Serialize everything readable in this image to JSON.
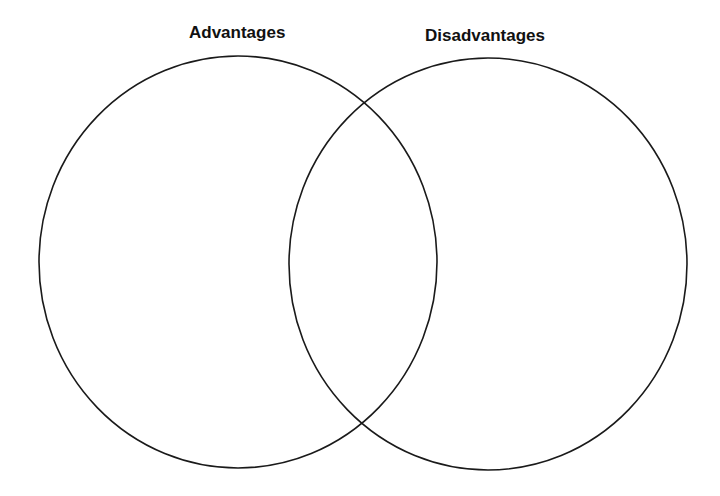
{
  "diagram": {
    "type": "venn",
    "sets": [
      {
        "label": "Advantages",
        "cx": 238,
        "cy": 262,
        "rx": 199,
        "ry": 206
      },
      {
        "label": "Disadvantages",
        "cx": 488,
        "cy": 264,
        "rx": 199,
        "ry": 206
      }
    ],
    "stroke_color": "#1a1a1a",
    "background": "#ffffff"
  }
}
